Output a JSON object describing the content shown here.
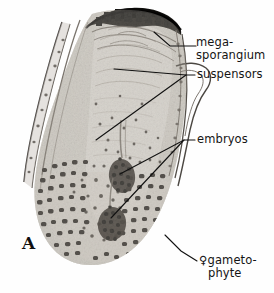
{
  "figure": {
    "panel_letter": "A",
    "image_kind": "light micrograph, black and white"
  },
  "colors": {
    "background": "#fefefe",
    "tissue_light": "#e8e6e2",
    "tissue_mid": "#bdb9b2",
    "tissue_dark": "#6f6a63",
    "stain_dark": "#2b2824",
    "leader_line": "#111111",
    "text": "#141414"
  },
  "labels": [
    {
      "id": "megasporangium",
      "line1": "mega-",
      "line2": "sporangium",
      "x": 196,
      "y": 36,
      "leader": "horizontal"
    },
    {
      "id": "suspensors",
      "line1": "suspensors",
      "line2": "",
      "x": 196,
      "y": 68,
      "leader": "forked"
    },
    {
      "id": "embryos",
      "line1": "embryos",
      "line2": "",
      "x": 196,
      "y": 133,
      "leader": "forked"
    },
    {
      "id": "gametophyte",
      "symbol": "♀",
      "line1": "gameto-",
      "line2": "phyte",
      "x": 206,
      "y": 255,
      "leader": "diagonal"
    }
  ],
  "leader_lines": [
    {
      "name": "megasporangium-leader",
      "points": "196,46 168,46 152,31"
    },
    {
      "name": "suspensors-leader-main",
      "points": "194,75 186,75"
    },
    {
      "name": "suspensors-leader-upper",
      "points": "186,75 114,69"
    },
    {
      "name": "suspensors-leader-lower",
      "points": "186,75 97,139"
    },
    {
      "name": "embryos-leader-main",
      "points": "194,140 184,140"
    },
    {
      "name": "embryos-leader-upper",
      "points": "184,140 120,173"
    },
    {
      "name": "embryos-leader-lower",
      "points": "184,140 112,217"
    },
    {
      "name": "gametophyte-leader",
      "points": "196,261 180,250 166,236"
    }
  ],
  "specimen_regions": [
    {
      "name": "sporangium-wall-cap",
      "description": "dense black cap across apex"
    },
    {
      "name": "nucellus-tissue",
      "description": "pale central tissue column"
    },
    {
      "name": "left-integument-sliver",
      "description": "thin curved strip along left margin"
    },
    {
      "name": "right-integument-outline",
      "description": "curved line along right margin"
    },
    {
      "name": "female-gametophyte",
      "description": "large dark-stained cellular base"
    },
    {
      "name": "embryo-upper",
      "description": "dense cluster at mid height"
    },
    {
      "name": "embryo-lower",
      "description": "dense cluster near base"
    }
  ]
}
